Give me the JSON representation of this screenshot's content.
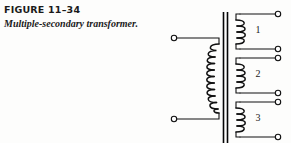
{
  "figure": {
    "number_label": "FIGURE 11–34",
    "title": "Multiple-secondary transformer."
  },
  "diagram": {
    "type": "transformer-schematic",
    "primary": {
      "name": "primary-winding",
      "turns": 10,
      "terminal_count": 2
    },
    "core": {
      "name": "iron-core",
      "line_count": 2
    },
    "secondaries": [
      {
        "label": "1",
        "turns": 4,
        "terminal_count": 2
      },
      {
        "label": "2",
        "turns": 4,
        "terminal_count": 2
      },
      {
        "label": "3",
        "turns": 4,
        "terminal_count": 2
      }
    ]
  },
  "colors": {
    "ink": "#111111",
    "background": "#fdfdfc"
  }
}
